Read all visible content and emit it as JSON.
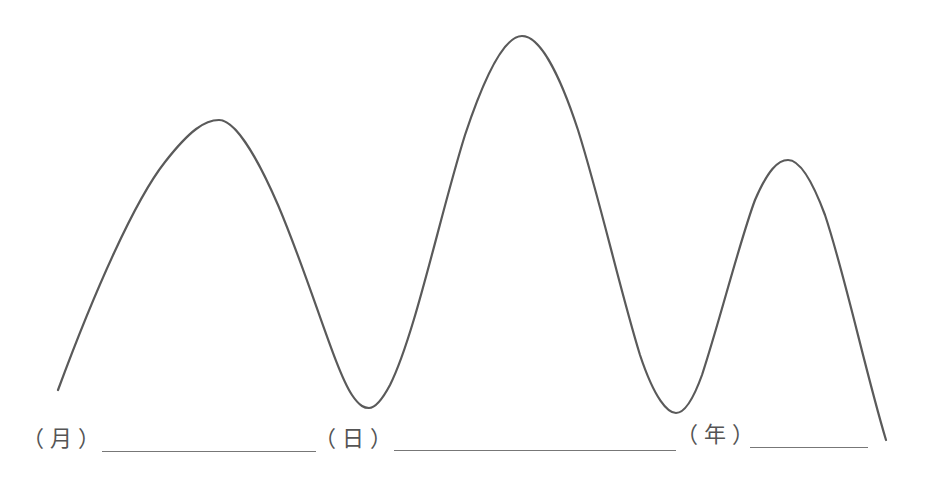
{
  "diagram": {
    "type": "wave-curve",
    "stroke_color": "#5a5a5a",
    "curve_points": [
      {
        "name": "start",
        "x": 58,
        "y": 390
      },
      {
        "name": "peak-1",
        "x": 219,
        "y": 120
      },
      {
        "name": "trough-1",
        "x": 369,
        "y": 408
      },
      {
        "name": "peak-2",
        "x": 522,
        "y": 36
      },
      {
        "name": "trough-2",
        "x": 676,
        "y": 413
      },
      {
        "name": "peak-3",
        "x": 788,
        "y": 160
      },
      {
        "name": "end",
        "x": 886,
        "y": 440
      }
    ],
    "labels": [
      {
        "text": "（月）",
        "x": 22
      },
      {
        "text": "（日）",
        "x": 314
      },
      {
        "text": "（年）",
        "x": 676
      }
    ],
    "blanks": [
      {
        "x1": 102,
        "x2": 316,
        "y": 451
      },
      {
        "x1": 394,
        "x2": 676,
        "y": 450
      },
      {
        "x1": 750,
        "x2": 868,
        "y": 447
      }
    ]
  }
}
